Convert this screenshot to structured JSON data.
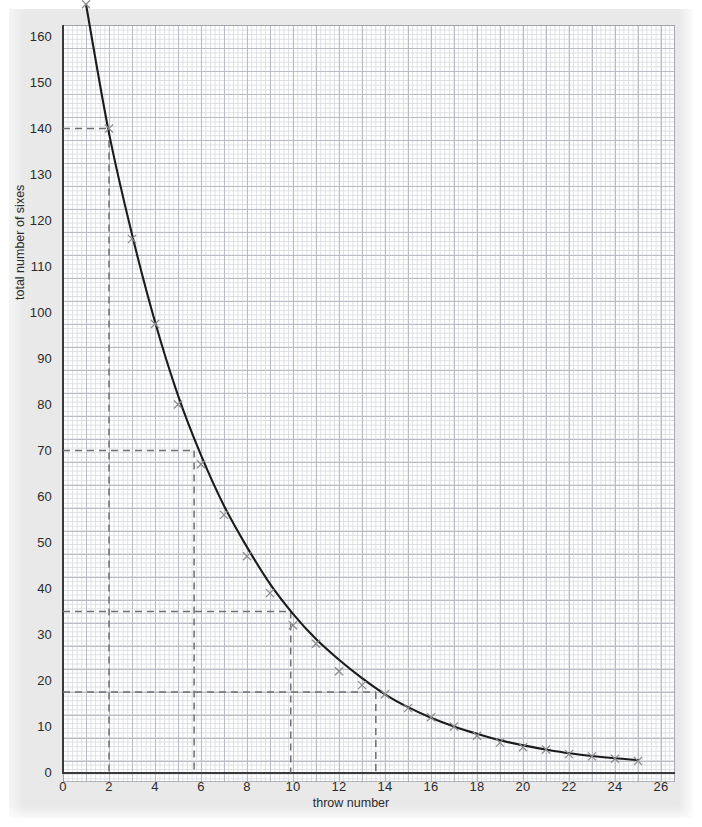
{
  "chart_data": {
    "type": "scatter",
    "title": "",
    "xlabel": "throw number",
    "ylabel": "total number of sixes",
    "xlim": [
      0,
      27.5
    ],
    "ylim": [
      0,
      177
    ],
    "xticks": [
      0,
      2,
      4,
      6,
      8,
      10,
      12,
      14,
      16,
      18,
      20,
      22,
      24,
      26
    ],
    "yticks": [
      0,
      10,
      20,
      30,
      40,
      50,
      60,
      70,
      80,
      90,
      100,
      110,
      120,
      130,
      140,
      150,
      160,
      170
    ],
    "grid": "graph paper, minor every 1 unit x / 2 units y, major every 5 minor",
    "legend": "none",
    "series": [
      {
        "name": "total number of sixes",
        "marker": "x",
        "x": [
          1,
          2,
          3,
          4,
          5,
          6,
          7,
          8,
          9,
          10,
          11,
          12,
          13,
          14,
          15,
          16,
          17,
          18,
          19,
          20,
          21,
          22,
          23,
          24,
          25
        ],
        "y": [
          167,
          140,
          116,
          97.5,
          80,
          67,
          56,
          47,
          39,
          32,
          28,
          22,
          19,
          17,
          14,
          12,
          10,
          8,
          6.5,
          5.5,
          5,
          4,
          3.5,
          3,
          2.5
        ]
      }
    ],
    "fitted_curve": {
      "description": "smooth decreasing best-fit curve through the crosses",
      "points": [
        [
          1,
          167
        ],
        [
          2,
          139
        ],
        [
          3,
          117
        ],
        [
          4,
          98
        ],
        [
          5,
          82
        ],
        [
          6,
          69
        ],
        [
          7,
          58
        ],
        [
          8,
          49
        ],
        [
          9,
          41
        ],
        [
          10,
          34.5
        ],
        [
          11,
          29
        ],
        [
          12,
          24.5
        ],
        [
          13,
          20.5
        ],
        [
          14,
          17
        ],
        [
          15,
          14.2
        ],
        [
          16,
          11.9
        ],
        [
          17,
          10
        ],
        [
          18,
          8.4
        ],
        [
          19,
          7
        ],
        [
          20,
          5.9
        ],
        [
          21,
          5
        ],
        [
          22,
          4.2
        ],
        [
          23,
          3.6
        ],
        [
          24,
          3.1
        ],
        [
          25,
          2.7
        ]
      ]
    },
    "annotations": [
      {
        "type": "dashed-guide",
        "y": 140,
        "x": 2.0,
        "note": "read-off at throw 2 gives 140 sixes"
      },
      {
        "type": "dashed-guide",
        "y": 70,
        "x": 5.7,
        "note": "read-off at 70 sixes gives throw 5.7"
      },
      {
        "type": "dashed-guide",
        "y": 35,
        "x": 9.9,
        "note": "read-off at 35 sixes gives throw 9.9"
      },
      {
        "type": "dashed-guide",
        "y": 17.5,
        "x": 13.6,
        "note": "read-off at 17.5 sixes gives throw 13.6"
      }
    ]
  },
  "colors": {
    "curve": "#1b1b1b",
    "marker": "#8c8c8c",
    "guide": "#6f6f6f",
    "axis": "#3a3a3a",
    "grid_minor": "#dcdee3",
    "grid_major": "#b9bcc4",
    "page": "#e9e9e9",
    "plot_bg": "#ffffff",
    "text": "#2b2b2b"
  }
}
